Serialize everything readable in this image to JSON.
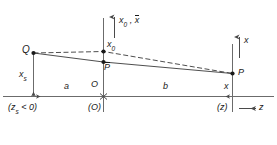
{
  "figure": {
    "axis_labels": {
      "vertical_center_main": "x",
      "vertical_center_sub": "0",
      "vertical_center_second": "x",
      "vertical_center_separator": " , ",
      "vertical_right": "x",
      "horizontal_right": "z"
    },
    "points": {
      "q": "Q",
      "x0": "x",
      "x0_sub": "0",
      "pbar": "P",
      "p": "P",
      "origin": "O"
    },
    "segments": {
      "xs": "x",
      "xs_sub": "s",
      "a": "a",
      "b": "b",
      "x_right": "x"
    },
    "coordinate_notes": {
      "left": "(z",
      "left_sub": "s",
      "left_tail": " < 0)",
      "origin": "(O)",
      "right": "(z)"
    },
    "colors": {
      "line": "#3a3a3a",
      "axis": "#6b6b6b",
      "text": "#1a1a1a",
      "background": "#ffffff"
    }
  }
}
